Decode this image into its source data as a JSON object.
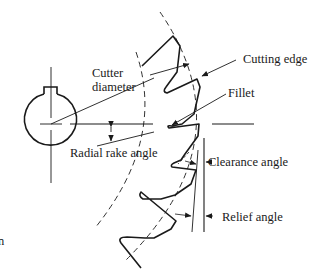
{
  "diagram": {
    "type": "milling-cutter-tooth-geometry",
    "stroke_color": "#1a1a1a",
    "background_color": "#ffffff",
    "labels": {
      "cutter_diameter_line1": "Cutter",
      "cutter_diameter_line2": "diameter",
      "cutting_edge": "Cutting edge",
      "fillet": "Fillet",
      "radial_rake_angle": "Radial rake angle",
      "clearance_angle": "Clearance angle",
      "relief_angle": "Relief angle",
      "left_edge_fragment": "n"
    },
    "components": [
      "hub-with-keyway",
      "center-crosshair",
      "cutter-diameter-line",
      "inner-dashed-arc",
      "outer-dashed-arc",
      "tooth-profile",
      "radial-rake-reference-lines",
      "clearance-angle-lines",
      "relief-angle-lines"
    ]
  }
}
